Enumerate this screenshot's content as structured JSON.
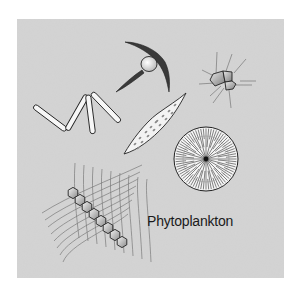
{
  "figure": {
    "caption": "Phytoplankton",
    "organisms": [
      {
        "id": "filament-chain",
        "description": "zig-zag chain of rod-shaped cells"
      },
      {
        "id": "spined-cell",
        "description": "cell with two long curved spines"
      },
      {
        "id": "cluster-colony",
        "description": "small polygonal cell cluster with radiating setae"
      },
      {
        "id": "pennate-diatom",
        "description": "elongated spindle-shaped cell with dotted interior"
      },
      {
        "id": "centric-diatom",
        "description": "circular cell with radial striations"
      },
      {
        "id": "chain-colony",
        "description": "chain of hexagonal cells within a mesh of long bristles"
      }
    ]
  },
  "colors": {
    "panel": "#d4d4d4",
    "outline": "#222222",
    "cell_fill": "#f2f2f2",
    "cell_shade": "#9a9a9a",
    "bristle": "#7a7a7a"
  }
}
